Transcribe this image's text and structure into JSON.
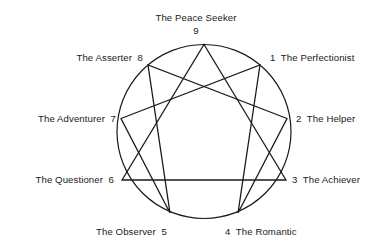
{
  "diagram": {
    "stroke_color": "#1a1a1a",
    "background_color": "#ffffff",
    "circle": {
      "cx": 204,
      "cy": 131.5,
      "r": 87
    },
    "points": [
      {
        "num": "9",
        "label": "The Peace Seeker",
        "side": "top",
        "x": 204,
        "y": 44.5
      },
      {
        "num": "1",
        "label": "The Perfectionist",
        "side": "right",
        "x": 260,
        "y": 65
      },
      {
        "num": "2",
        "label": "The Helper",
        "side": "right",
        "x": 287,
        "y": 118.5
      },
      {
        "num": "3",
        "label": "The Achiever",
        "side": "right",
        "x": 286,
        "y": 180
      },
      {
        "num": "4",
        "label": "The Romantic",
        "side": "bottom",
        "x": 238,
        "y": 213
      },
      {
        "num": "5",
        "label": "The Observer",
        "side": "bottom",
        "x": 170,
        "y": 213
      },
      {
        "num": "6",
        "label": "The Questioner",
        "side": "left",
        "x": 122,
        "y": 180
      },
      {
        "num": "7",
        "label": "The Adventurer",
        "side": "left",
        "x": 121,
        "y": 118.5
      },
      {
        "num": "8",
        "label": "The Asserter",
        "side": "left",
        "x": 148,
        "y": 65
      }
    ],
    "triangle_path": "9-3-6-9",
    "hexad_path": "1-4-2-8-5-7-1"
  }
}
